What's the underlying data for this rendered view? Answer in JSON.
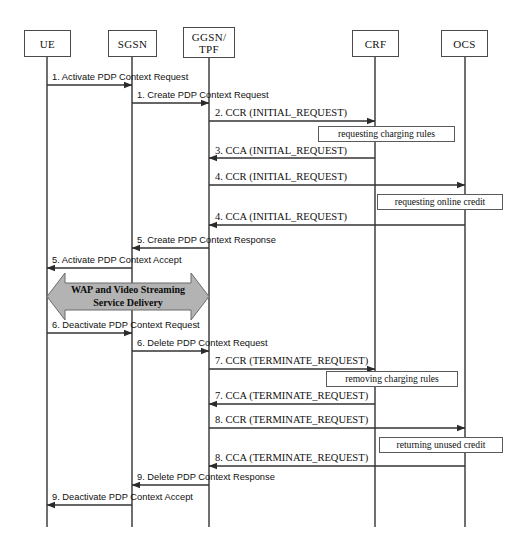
{
  "diagram": {
    "type": "uml-sequence-diagram",
    "background_color": "#ffffff",
    "line_color": "#333333",
    "block_arrow_fill": "#b3b3b3",
    "actors": [
      {
        "id": "ue",
        "label": "UE",
        "lifeline_x": 47,
        "box": {
          "x": 24,
          "y": 30,
          "w": 47,
          "h": 27
        }
      },
      {
        "id": "sgsn",
        "label": "SGSN",
        "lifeline_x": 132,
        "box": {
          "x": 108,
          "y": 30,
          "w": 49,
          "h": 27
        }
      },
      {
        "id": "ggsn",
        "label": "GGSN/\nTPF",
        "label_line1": "GGSN/",
        "label_line2": "TPF",
        "lifeline_x": 209,
        "box": {
          "x": 183,
          "y": 27,
          "w": 52,
          "h": 31
        }
      },
      {
        "id": "crf",
        "label": "CRF",
        "lifeline_x": 375,
        "box": {
          "x": 352,
          "y": 30,
          "w": 47,
          "h": 27
        }
      },
      {
        "id": "ocs",
        "label": "OCS",
        "lifeline_x": 465,
        "box": {
          "x": 441,
          "y": 30,
          "w": 47,
          "h": 27
        }
      }
    ],
    "lifeline_top": 57,
    "lifeline_bottom": 527,
    "messages": [
      {
        "n": 1,
        "label": "1. Activate PDP Context Request",
        "from": "ue",
        "to": "sgsn",
        "y": 85,
        "dir": "right",
        "font": "sans",
        "label_x": 52,
        "label_y": 72
      },
      {
        "n": 2,
        "label": "1. Create PDP Context Request",
        "from": "sgsn",
        "to": "ggsn",
        "y": 103,
        "dir": "right",
        "font": "sans",
        "label_x": 137,
        "label_y": 90
      },
      {
        "n": 3,
        "label": "2. CCR (INITIAL_REQUEST)",
        "from": "ggsn",
        "to": "crf",
        "y": 121,
        "dir": "right",
        "font": "serif",
        "label_x": 215,
        "label_y": 107
      },
      {
        "n": 4,
        "label": "3. CCA (INITIAL_REQUEST)",
        "from": "crf",
        "to": "ggsn",
        "y": 158,
        "dir": "left",
        "font": "serif",
        "label_x": 215,
        "label_y": 145
      },
      {
        "n": 5,
        "label": "4. CCR (INITIAL_REQUEST)",
        "from": "ggsn",
        "to": "ocs",
        "y": 185,
        "dir": "right",
        "font": "serif",
        "label_x": 215,
        "label_y": 171
      },
      {
        "n": 6,
        "label": "4. CCA (INITIAL_REQUEST)",
        "from": "ocs",
        "to": "ggsn",
        "y": 225,
        "dir": "left",
        "font": "serif",
        "label_x": 215,
        "label_y": 211
      },
      {
        "n": 7,
        "label": "5. Create PDP Context Response",
        "from": "ggsn",
        "to": "sgsn",
        "y": 248,
        "dir": "left",
        "font": "sans",
        "label_x": 137,
        "label_y": 235
      },
      {
        "n": 8,
        "label": "5. Activate PDP Context Accept",
        "from": "sgsn",
        "to": "ue",
        "y": 268,
        "dir": "left",
        "font": "sans",
        "label_x": 52,
        "label_y": 255
      },
      {
        "n": 9,
        "label": "6. Deactivate PDP Context Request",
        "from": "ue",
        "to": "sgsn",
        "y": 333,
        "dir": "right",
        "font": "sans",
        "label_x": 52,
        "label_y": 320
      },
      {
        "n": 10,
        "label": "6. Delete PDP Context Request",
        "from": "sgsn",
        "to": "ggsn",
        "y": 351,
        "dir": "right",
        "font": "sans",
        "label_x": 137,
        "label_y": 338
      },
      {
        "n": 11,
        "label": "7. CCR (TERMINATE_REQUEST)",
        "from": "ggsn",
        "to": "crf",
        "y": 369,
        "dir": "right",
        "font": "serif",
        "label_x": 215,
        "label_y": 355
      },
      {
        "n": 12,
        "label": "7. CCA (TERMINATE_REQUEST)",
        "from": "crf",
        "to": "ggsn",
        "y": 404,
        "dir": "left",
        "font": "serif",
        "label_x": 215,
        "label_y": 390
      },
      {
        "n": 13,
        "label": "8. CCR (TERMINATE_REQUEST)",
        "from": "ggsn",
        "to": "ocs",
        "y": 428,
        "dir": "right",
        "font": "serif",
        "label_x": 215,
        "label_y": 414
      },
      {
        "n": 14,
        "label": "8. CCA (TERMINATE_REQUEST)",
        "from": "ocs",
        "to": "ggsn",
        "y": 466,
        "dir": "left",
        "font": "serif",
        "label_x": 215,
        "label_y": 452
      },
      {
        "n": 15,
        "label": "9. Delete PDP Context Response",
        "from": "ggsn",
        "to": "sgsn",
        "y": 485,
        "dir": "left",
        "font": "sans",
        "label_x": 137,
        "label_y": 472
      },
      {
        "n": 16,
        "label": "9. Deactivate PDP Context Accept",
        "from": "sgsn",
        "to": "ue",
        "y": 505,
        "dir": "left",
        "font": "sans",
        "label_x": 52,
        "label_y": 492
      }
    ],
    "notes": [
      {
        "id": "note-requesting-charging-rules",
        "label": "requesting charging rules",
        "x": 318,
        "y": 126,
        "w": 137,
        "h": 16
      },
      {
        "id": "note-requesting-online-credit",
        "label": "requesting online credit",
        "x": 377,
        "y": 194,
        "w": 126,
        "h": 16
      },
      {
        "id": "note-removing-charging-rules",
        "label": "removing charging rules",
        "x": 326,
        "y": 371,
        "w": 132,
        "h": 16
      },
      {
        "id": "note-returning-unused-credit",
        "label": "returning unused credit",
        "x": 379,
        "y": 437,
        "w": 124,
        "h": 16
      }
    ],
    "block_arrow": {
      "id": "service-delivery-block",
      "label_line1": "WAP and Video Streaming",
      "label_line2": "Service Delivery",
      "from": "ue",
      "to": "ggsn",
      "x": 47,
      "y": 273,
      "w": 162,
      "h": 47,
      "fill": "#b3b3b3",
      "stroke": "#6b6b6b"
    }
  }
}
